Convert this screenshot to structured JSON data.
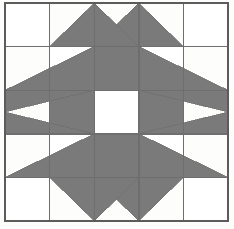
{
  "image": {
    "title": "Patchwork Quilt Block Diagram",
    "kind": "quilt-block-pattern",
    "width": 234,
    "height": 229,
    "background_color": "#fdfdfc"
  },
  "palette": {
    "fill_dark": "#7a7a7a",
    "fill_light": "#ffffff",
    "line_color": "#6e6e6e",
    "outer_line_color": "#5c5c5c",
    "page_background": "#fdfdfc"
  },
  "block": {
    "name": "Sawtooth Star Checkerboard Block",
    "grid_columns": 5,
    "grid_rows": 5,
    "frame": {
      "x": 5,
      "y": 3,
      "width": 223,
      "height": 218
    },
    "cell_width": 44.6,
    "cell_height": 43.6,
    "line_width": 1.4,
    "outer_line_width": 1.8,
    "column_x": [
      5,
      49.6,
      94.2,
      138.8,
      183.4,
      228
    ],
    "row_y": [
      3,
      46.6,
      90.2,
      133.8,
      177.4,
      221
    ]
  },
  "center_checkerboard": {
    "description": "3 by 3 alternating checkerboard occupying the middle nine cells",
    "cells": [
      {
        "row": 1,
        "col": 1,
        "fill": "light"
      },
      {
        "row": 1,
        "col": 2,
        "fill": "dark"
      },
      {
        "row": 1,
        "col": 3,
        "fill": "light"
      },
      {
        "row": 2,
        "col": 1,
        "fill": "dark"
      },
      {
        "row": 2,
        "col": 2,
        "fill": "light"
      },
      {
        "row": 2,
        "col": 3,
        "fill": "dark"
      },
      {
        "row": 3,
        "col": 1,
        "fill": "light"
      },
      {
        "row": 3,
        "col": 2,
        "fill": "dark"
      },
      {
        "row": 3,
        "col": 3,
        "fill": "light"
      }
    ]
  },
  "corner_cells": [
    {
      "name": "corner-top-left",
      "row": 0,
      "col": 0,
      "fill": "light"
    },
    {
      "name": "corner-top-right",
      "row": 0,
      "col": 4,
      "fill": "light"
    },
    {
      "name": "corner-bottom-left",
      "row": 4,
      "col": 0,
      "fill": "light"
    },
    {
      "name": "corner-bottom-right",
      "row": 4,
      "col": 4,
      "fill": "light"
    }
  ],
  "star_points": {
    "description": "Eight pairs of dark right triangles forming star points on each of the four edges",
    "triangles": [
      {
        "name": "point-top-left-a",
        "edge": "top",
        "points": "49.6,46.6 94.2,3 94.2,46.6"
      },
      {
        "name": "point-top-left-b",
        "edge": "top",
        "points": "94.2,46.6 138.8,3 138.8,46.6"
      },
      {
        "name": "point-top-right-a",
        "edge": "top",
        "points": "138.8,3 183.4,46.6 138.8,46.6"
      },
      {
        "name": "point-top-right-b",
        "edge": "top",
        "points": "94.2,3 138.8,46.6 94.2,46.6"
      },
      {
        "name": "point-left-upper-a",
        "edge": "left",
        "points": "5,90.2 94.2,46.6 94.2,90.2"
      },
      {
        "name": "point-left-upper-b",
        "edge": "left",
        "points": "5,90.2 94.2,90.2 5,112"
      },
      {
        "name": "point-left-lower-a",
        "edge": "left",
        "points": "5,133.8 94.2,133.8 5,112"
      },
      {
        "name": "point-left-lower-b",
        "edge": "left",
        "points": "5,177.4 94.2,133.8 94.2,177.4"
      },
      {
        "name": "point-right-upper-a",
        "edge": "right",
        "points": "138.8,46.6 228,90.2 138.8,90.2"
      },
      {
        "name": "point-right-upper-b",
        "edge": "right",
        "points": "138.8,90.2 228,90.2 228,112"
      },
      {
        "name": "point-right-lower-a",
        "edge": "right",
        "points": "138.8,133.8 228,133.8 228,112"
      },
      {
        "name": "point-right-lower-b",
        "edge": "right",
        "points": "138.8,133.8 138.8,177.4 228,177.4"
      },
      {
        "name": "point-bottom-left-a",
        "edge": "bottom",
        "points": "49.6,177.4 94.2,177.4 94.2,221"
      },
      {
        "name": "point-bottom-left-b",
        "edge": "bottom",
        "points": "94.2,177.4 138.8,177.4 138.8,221"
      },
      {
        "name": "point-bottom-right-a",
        "edge": "bottom",
        "points": "138.8,177.4 183.4,177.4 138.8,221"
      },
      {
        "name": "point-bottom-right-b",
        "edge": "bottom",
        "points": "94.2,177.4 138.8,177.4 94.2,221"
      }
    ]
  },
  "grid_lines": {
    "vertical_x": [
      5,
      49.6,
      94.2,
      138.8,
      183.4,
      228
    ],
    "horizontal_y": [
      3,
      46.6,
      90.2,
      133.8,
      177.4,
      221
    ]
  }
}
